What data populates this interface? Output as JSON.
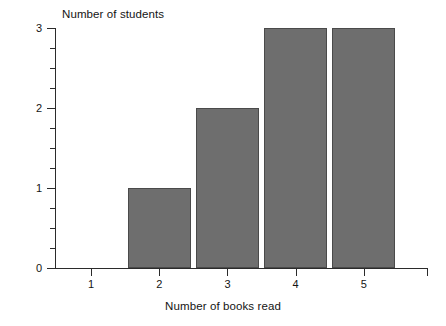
{
  "chart_data": {
    "type": "bar",
    "title": "",
    "xlabel": "Number of books read",
    "ylabel": "Number of students",
    "categories": [
      "1",
      "2",
      "3",
      "4",
      "5"
    ],
    "values": [
      0,
      1,
      2,
      3,
      3
    ],
    "ylim": [
      0,
      3
    ],
    "y_ticks": [
      "0",
      "1",
      "2",
      "3"
    ],
    "y_minor_tick_step": 0.25,
    "grid": false,
    "legend": null,
    "series": [
      {
        "name": "Number of students",
        "values": [
          0,
          1,
          2,
          3,
          3
        ]
      }
    ],
    "bar_color": "#6e6e6e",
    "bar_border_color": "#4a4a4a",
    "axis_color": "#2b2b2b",
    "background": "#ffffff"
  },
  "axes": {
    "y_title": "Number of students",
    "x_title": "Number of books read",
    "y_tick_labels": [
      "0",
      "1",
      "2",
      "3"
    ],
    "x_tick_labels": [
      "1",
      "2",
      "3",
      "4",
      "5"
    ]
  }
}
